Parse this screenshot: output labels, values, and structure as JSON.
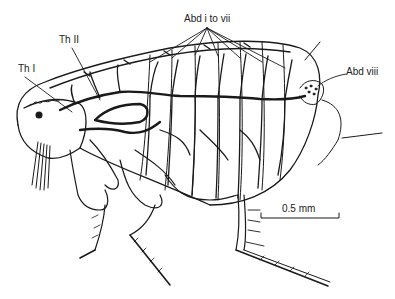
{
  "figure": {
    "labels": {
      "abd_i_vii": "Abd i to vii",
      "th_i": "Th I",
      "th_ii": "Th II",
      "abd_viii": "Abd viii"
    },
    "scale_bar": {
      "label": "0.5 mm"
    },
    "colors": {
      "ink": "#1a1a1a",
      "background": "#ffffff"
    }
  }
}
